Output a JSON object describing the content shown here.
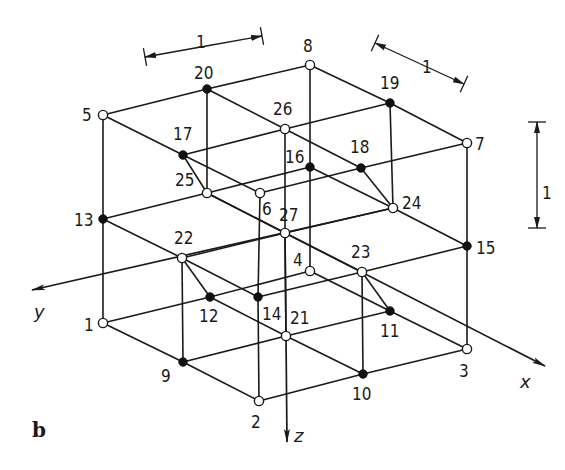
{
  "figure": {
    "panel_label": "b",
    "axes": {
      "x": {
        "label": "x",
        "from": [
          207,
          193
        ],
        "to": [
          545,
          366
        ]
      },
      "y": {
        "label": "y",
        "from": [
          393,
          208
        ],
        "to": [
          32,
          290
        ]
      },
      "z": {
        "label": "z",
        "from": [
          285,
          233
        ],
        "to": [
          287,
          442
        ]
      }
    },
    "dimensions": [
      {
        "label": "1",
        "orientation": "y-direction",
        "from": [
          145,
          57
        ],
        "to": [
          262,
          36
        ],
        "label_pos": [
          196,
          32
        ]
      },
      {
        "label": "1",
        "orientation": "x-direction",
        "from": [
          375,
          43
        ],
        "to": [
          464,
          84
        ],
        "label_pos": [
          422,
          57
        ]
      },
      {
        "label": "1",
        "orientation": "z-direction",
        "from": [
          537,
          122
        ],
        "to": [
          537,
          228
        ],
        "label_pos": [
          542,
          183
        ]
      }
    ],
    "nodes": [
      {
        "id": "1",
        "x": 103,
        "y": 323,
        "type": "corner",
        "filled": false,
        "lx": 84,
        "ly": 331
      },
      {
        "id": "2",
        "x": 259,
        "y": 401,
        "type": "corner",
        "filled": false,
        "lx": 251,
        "ly": 428
      },
      {
        "id": "3",
        "x": 467,
        "y": 349,
        "type": "corner",
        "filled": false,
        "lx": 459,
        "ly": 377
      },
      {
        "id": "4",
        "x": 310,
        "y": 271,
        "type": "corner",
        "filled": false,
        "lx": 293,
        "ly": 266
      },
      {
        "id": "5",
        "x": 103,
        "y": 115,
        "type": "corner",
        "filled": false,
        "lx": 82,
        "ly": 121
      },
      {
        "id": "6",
        "x": 260,
        "y": 193,
        "type": "corner",
        "filled": false,
        "lx": 262,
        "ly": 215
      },
      {
        "id": "7",
        "x": 467,
        "y": 143,
        "type": "corner",
        "filled": false,
        "lx": 475,
        "ly": 150
      },
      {
        "id": "8",
        "x": 310,
        "y": 65,
        "type": "corner",
        "filled": false,
        "lx": 303,
        "ly": 52
      },
      {
        "id": "9",
        "x": 183,
        "y": 362,
        "type": "edge-mid",
        "filled": true,
        "lx": 161,
        "ly": 382
      },
      {
        "id": "10",
        "x": 363,
        "y": 374,
        "type": "edge-mid",
        "filled": true,
        "lx": 352,
        "ly": 400
      },
      {
        "id": "11",
        "x": 390,
        "y": 311,
        "type": "edge-mid",
        "filled": true,
        "lx": 380,
        "ly": 337
      },
      {
        "id": "12",
        "x": 210,
        "y": 297,
        "type": "edge-mid",
        "filled": true,
        "lx": 199,
        "ly": 322
      },
      {
        "id": "13",
        "x": 103,
        "y": 219,
        "type": "edge-mid",
        "filled": true,
        "lx": 74,
        "ly": 226
      },
      {
        "id": "14",
        "x": 258,
        "y": 297,
        "type": "edge-mid",
        "filled": true,
        "lx": 262,
        "ly": 320
      },
      {
        "id": "15",
        "x": 467,
        "y": 246,
        "type": "edge-mid",
        "filled": true,
        "lx": 476,
        "ly": 254
      },
      {
        "id": "16",
        "x": 310,
        "y": 167,
        "type": "edge-mid",
        "filled": true,
        "lx": 285,
        "ly": 163
      },
      {
        "id": "17",
        "x": 183,
        "y": 155,
        "type": "edge-mid",
        "filled": true,
        "lx": 173,
        "ly": 140
      },
      {
        "id": "18",
        "x": 361,
        "y": 168,
        "type": "edge-mid",
        "filled": true,
        "lx": 350,
        "ly": 153
      },
      {
        "id": "19",
        "x": 390,
        "y": 103,
        "type": "edge-mid",
        "filled": true,
        "lx": 380,
        "ly": 89
      },
      {
        "id": "20",
        "x": 207,
        "y": 89,
        "type": "edge-mid",
        "filled": true,
        "lx": 194,
        "ly": 79
      },
      {
        "id": "21",
        "x": 286,
        "y": 336,
        "type": "face-center",
        "filled": false,
        "lx": 290,
        "ly": 324
      },
      {
        "id": "22",
        "x": 182,
        "y": 258,
        "type": "face-center",
        "filled": false,
        "lx": 174,
        "ly": 244
      },
      {
        "id": "23",
        "x": 362,
        "y": 272,
        "type": "face-center",
        "filled": false,
        "lx": 351,
        "ly": 258
      },
      {
        "id": "24",
        "x": 393,
        "y": 208,
        "type": "face-center",
        "filled": false,
        "lx": 402,
        "ly": 209
      },
      {
        "id": "25",
        "x": 207,
        "y": 193,
        "type": "face-center",
        "filled": false,
        "lx": 175,
        "ly": 186
      },
      {
        "id": "26",
        "x": 285,
        "y": 129,
        "type": "face-center",
        "filled": false,
        "lx": 273,
        "ly": 115
      },
      {
        "id": "27",
        "x": 285,
        "y": 233,
        "type": "center",
        "filled": false,
        "lx": 279,
        "ly": 221
      }
    ],
    "edges": [
      [
        "5",
        "20"
      ],
      [
        "20",
        "8"
      ],
      [
        "5",
        "17"
      ],
      [
        "17",
        "6"
      ],
      [
        "8",
        "19"
      ],
      [
        "19",
        "7"
      ],
      [
        "6",
        "18"
      ],
      [
        "18",
        "7"
      ],
      [
        "20",
        "26"
      ],
      [
        "26",
        "18"
      ],
      [
        "17",
        "26"
      ],
      [
        "26",
        "19"
      ],
      [
        "5",
        "13"
      ],
      [
        "13",
        "1"
      ],
      [
        "6",
        "14"
      ],
      [
        "14",
        "2"
      ],
      [
        "7",
        "15"
      ],
      [
        "15",
        "3"
      ],
      [
        "8",
        "16"
      ],
      [
        "16",
        "4"
      ],
      [
        "13",
        "25"
      ],
      [
        "25",
        "16"
      ],
      [
        "13",
        "22"
      ],
      [
        "22",
        "14"
      ],
      [
        "16",
        "24"
      ],
      [
        "24",
        "15"
      ],
      [
        "14",
        "23"
      ],
      [
        "23",
        "15"
      ],
      [
        "1",
        "12"
      ],
      [
        "12",
        "4"
      ],
      [
        "1",
        "9"
      ],
      [
        "9",
        "2"
      ],
      [
        "4",
        "11"
      ],
      [
        "11",
        "3"
      ],
      [
        "2",
        "10"
      ],
      [
        "10",
        "3"
      ],
      [
        "12",
        "21"
      ],
      [
        "21",
        "11"
      ],
      [
        "9",
        "21"
      ],
      [
        "21",
        "10"
      ],
      [
        "25",
        "27"
      ],
      [
        "27",
        "23"
      ],
      [
        "22",
        "27"
      ],
      [
        "27",
        "24"
      ],
      [
        "17",
        "25"
      ],
      [
        "26",
        "27"
      ],
      [
        "18",
        "24"
      ],
      [
        "20",
        "25"
      ],
      [
        "19",
        "24"
      ],
      [
        "22",
        "12"
      ],
      [
        "27",
        "21"
      ],
      [
        "23",
        "11"
      ],
      [
        "22",
        "9"
      ],
      [
        "23",
        "10"
      ]
    ]
  }
}
